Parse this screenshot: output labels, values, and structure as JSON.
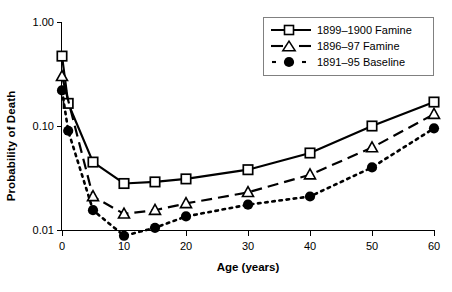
{
  "chart_data": {
    "type": "line",
    "title": "",
    "xlabel": "Age (years)",
    "ylabel": "Probability of Death",
    "yscale": "log",
    "ylim": [
      0.01,
      1.0
    ],
    "xlim": [
      0,
      60
    ],
    "grid": false,
    "legend_position": "top-right",
    "ytick_labels": [
      "1.00",
      "0.10",
      "0.01"
    ],
    "ytick_values": [
      1.0,
      0.1,
      0.01
    ],
    "xtick_labels": [
      "0",
      "10",
      "20",
      "30",
      "40",
      "50",
      "60"
    ],
    "xtick_values": [
      0,
      10,
      20,
      30,
      40,
      50,
      60
    ],
    "series": [
      {
        "name": "1899–1900 Famine",
        "marker": "open-square",
        "line": "solid",
        "color": "#000000",
        "x": [
          0,
          1,
          5,
          10,
          15,
          20,
          30,
          40,
          50,
          60
        ],
        "values": [
          0.47,
          0.165,
          0.045,
          0.028,
          0.029,
          0.031,
          0.038,
          0.055,
          0.1,
          0.17
        ]
      },
      {
        "name": "1896–97 Famine",
        "marker": "open-triangle",
        "line": "dashed",
        "color": "#000000",
        "x": [
          0,
          5,
          10,
          15,
          20,
          30,
          40,
          50,
          60
        ],
        "values": [
          0.3,
          0.021,
          0.0143,
          0.0155,
          0.018,
          0.023,
          0.034,
          0.062,
          0.13
        ]
      },
      {
        "name": "1891–95 Baseline",
        "marker": "filled-circle",
        "line": "dotted",
        "color": "#000000",
        "x": [
          0,
          1,
          5,
          10,
          15,
          20,
          30,
          40,
          50,
          60
        ],
        "values": [
          0.22,
          0.09,
          0.0155,
          0.0088,
          0.0105,
          0.0135,
          0.0175,
          0.021,
          0.04,
          0.095
        ]
      }
    ]
  },
  "legend": {
    "items": [
      {
        "label": "1899–1900 Famine"
      },
      {
        "label": "1896–97 Famine"
      },
      {
        "label": "1891–95 Baseline"
      }
    ]
  }
}
